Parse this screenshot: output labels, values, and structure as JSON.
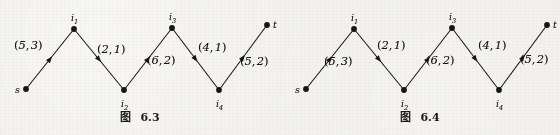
{
  "page": {
    "background_color": "#efeee9",
    "ink_color": "#151515"
  },
  "figures": [
    {
      "id": "figure-6-3",
      "caption_cjk": "图",
      "caption_number": "6.3",
      "nodes": [
        {
          "id": "s",
          "label": "s",
          "sub": "",
          "x": 26,
          "y": 89,
          "label_dx": -11,
          "label_dy": -4
        },
        {
          "id": "i1",
          "label": "i",
          "sub": "1",
          "x": 74,
          "y": 29,
          "label_dx": -3,
          "label_dy": -16
        },
        {
          "id": "i2",
          "label": "i",
          "sub": "2",
          "x": 124,
          "y": 90,
          "label_dx": -3,
          "label_dy": 9
        },
        {
          "id": "i3",
          "label": "i",
          "sub": "3",
          "x": 172,
          "y": 28,
          "label_dx": -3,
          "label_dy": -16
        },
        {
          "id": "i4",
          "label": "i",
          "sub": "4",
          "x": 219,
          "y": 90,
          "label_dx": -3,
          "label_dy": 9
        },
        {
          "id": "t",
          "label": "t",
          "sub": "",
          "x": 267,
          "y": 25,
          "label_dx": 6,
          "label_dy": -5
        }
      ],
      "edges": [
        {
          "id": "s-i1",
          "from": "s",
          "to": "i1",
          "capacity": 5,
          "flow": 3,
          "label": "(5, 3)",
          "label_x": 14,
          "label_y": 40
        },
        {
          "id": "i1-i2",
          "from": "i1",
          "to": "i2",
          "capacity": 2,
          "flow": 1,
          "label": "(2, 1)",
          "label_x": 97,
          "label_y": 44
        },
        {
          "id": "i2-i3",
          "from": "i2",
          "to": "i3",
          "capacity": 6,
          "flow": 2,
          "label": "(6, 2)",
          "label_x": 147,
          "label_y": 55
        },
        {
          "id": "i3-i4",
          "from": "i3",
          "to": "i4",
          "capacity": 4,
          "flow": 1,
          "label": "(4, 1)",
          "label_x": 198,
          "label_y": 42
        },
        {
          "id": "i4-t",
          "from": "i4",
          "to": "t",
          "capacity": 5,
          "flow": 2,
          "label": "(5, 2)",
          "label_x": 240,
          "label_y": 56
        }
      ]
    },
    {
      "id": "figure-6-4",
      "caption_cjk": "图",
      "caption_number": "6.4",
      "nodes": [
        {
          "id": "s",
          "label": "s",
          "sub": "",
          "x": 26,
          "y": 89,
          "label_dx": -11,
          "label_dy": -4
        },
        {
          "id": "i1",
          "label": "i",
          "sub": "1",
          "x": 74,
          "y": 29,
          "label_dx": -3,
          "label_dy": -16
        },
        {
          "id": "i2",
          "label": "i",
          "sub": "2",
          "x": 124,
          "y": 90,
          "label_dx": -3,
          "label_dy": 9
        },
        {
          "id": "i3",
          "label": "i",
          "sub": "3",
          "x": 172,
          "y": 28,
          "label_dx": -3,
          "label_dy": -16
        },
        {
          "id": "i4",
          "label": "i",
          "sub": "4",
          "x": 219,
          "y": 90,
          "label_dx": -3,
          "label_dy": 9
        },
        {
          "id": "t",
          "label": "t",
          "sub": "",
          "x": 267,
          "y": 25,
          "label_dx": 6,
          "label_dy": -5
        }
      ],
      "edges": [
        {
          "id": "s-i1",
          "from": "s",
          "to": "i1",
          "capacity": 5,
          "flow": 3,
          "label": "(5, 3)",
          "label_x": 44,
          "label_y": 56
        },
        {
          "id": "i1-i2",
          "from": "i1",
          "to": "i2",
          "capacity": 2,
          "flow": 1,
          "label": "(2, 1)",
          "label_x": 97,
          "label_y": 40
        },
        {
          "id": "i2-i3",
          "from": "i2",
          "to": "i3",
          "capacity": 6,
          "flow": 2,
          "label": "(6, 2)",
          "label_x": 146,
          "label_y": 55
        },
        {
          "id": "i3-i4",
          "from": "i3",
          "to": "i4",
          "capacity": 4,
          "flow": 1,
          "label": "(4, 1)",
          "label_x": 198,
          "label_y": 40
        },
        {
          "id": "i4-t",
          "from": "i4",
          "to": "t",
          "capacity": 5,
          "flow": 2,
          "label": "(5, 2)",
          "label_x": 240,
          "label_y": 54
        }
      ]
    }
  ]
}
